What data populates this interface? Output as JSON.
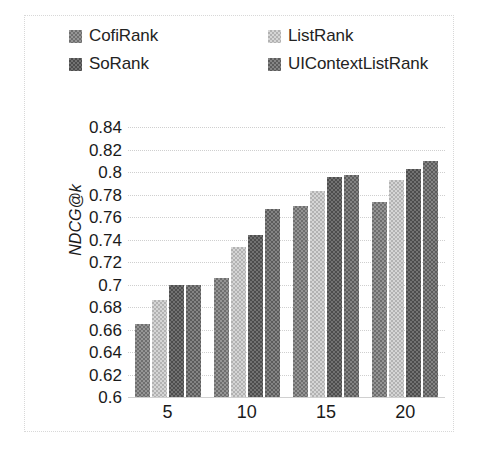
{
  "chart_data": {
    "type": "bar",
    "title": "",
    "xlabel": "",
    "ylabel": "NDCG@k",
    "categories": [
      "5",
      "10",
      "15",
      "20"
    ],
    "ylim": [
      0.6,
      0.84
    ],
    "ytick_step": 0.02,
    "yticks": [
      "0.84",
      "0.82",
      "0.8",
      "0.78",
      "0.76",
      "0.74",
      "0.72",
      "0.7",
      "0.68",
      "0.66",
      "0.64",
      "0.62",
      "0.6"
    ],
    "ytick_values": [
      0.84,
      0.82,
      0.8,
      0.78,
      0.76,
      0.74,
      0.72,
      0.7,
      0.68,
      0.66,
      0.64,
      0.62,
      0.6
    ],
    "grid": true,
    "legend_position": "top",
    "series": [
      {
        "name": "CofiRank",
        "color": "#7d7d7d",
        "pattern": "checker-medium",
        "values": [
          0.665,
          0.706,
          0.77,
          0.773
        ]
      },
      {
        "name": "ListRank",
        "color": "#bfbfbf",
        "pattern": "checker-light",
        "values": [
          0.686,
          0.733,
          0.783,
          0.793
        ]
      },
      {
        "name": "SoRank",
        "color": "#5b5b5b",
        "pattern": "checker-dark",
        "values": [
          0.7,
          0.744,
          0.796,
          0.803
        ]
      },
      {
        "name": "UIContextListRank",
        "color": "#6b6b6b",
        "pattern": "checker-dark2",
        "values": [
          0.7,
          0.767,
          0.797,
          0.81
        ]
      }
    ]
  },
  "legend": {
    "items": [
      {
        "label": "CofiRank",
        "swatch_name": "legend-swatch-cofirank"
      },
      {
        "label": "ListRank",
        "swatch_name": "legend-swatch-listrank"
      },
      {
        "label": "SoRank",
        "swatch_name": "legend-swatch-sorank"
      },
      {
        "label": "UIContextListRank",
        "swatch_name": "legend-swatch-uicontextlistrank"
      }
    ]
  }
}
